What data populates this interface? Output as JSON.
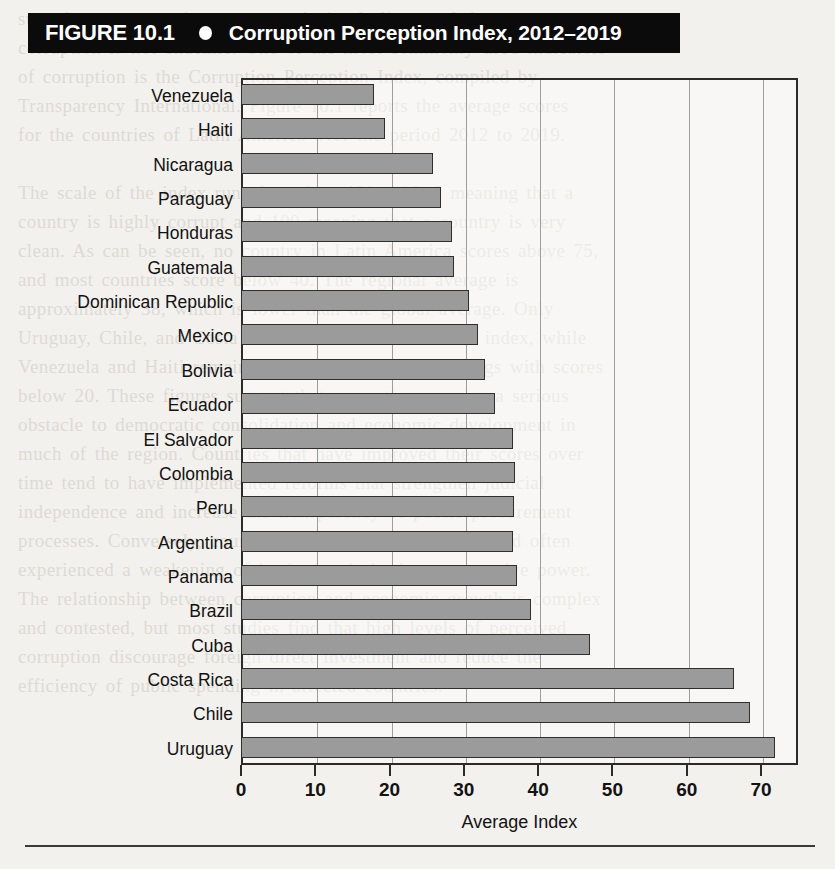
{
  "figure": {
    "label": "FIGURE 10.1",
    "bullet_icon": "bullet-dot-icon",
    "title": "Corruption Perception Index, 2012–2019"
  },
  "axis": {
    "x_title": "Average Index",
    "ticks": [
      "0",
      "10",
      "20",
      "30",
      "40",
      "50",
      "60",
      "70"
    ]
  },
  "colors": {
    "banner_background": "#0b0b0b",
    "banner_text": "#ffffff",
    "bar_fill": "#9b9b9b",
    "bar_border": "#2e2e2e",
    "grid": "#9d9d9d",
    "page_background": "#f3f1ed"
  },
  "ghost_text": "sure that a country is transparent in its dealings and that\ncorruption is not endemic. One of the most commonly used indicators\nof corruption is the Corruption Perception Index, compiled by\nTransparency International. Figure 10.1 reports the average scores\nfor the countries of Latin America over the period 2012 to 2019.\n\nThe scale of the index runs from 0 to 100, with 0 meaning that a\ncountry is highly corrupt and 100 meaning that a country is very\nclean. As can be seen, no country in Latin America scores above 75,\nand most countries score below 40. The regional average is\napproximately 38, which is lower than the global average. Only\nUruguay, Chile, and Costa Rica score above 60 on the index, while\nVenezuela and Haiti remain at the bottom of the rankings with scores\nbelow 20. These figures suggest that corruption remains a serious\nobstacle to democratic consolidation and economic development in\nmuch of the region. Countries that have improved their scores over\ntime tend to have implemented reforms that strengthen judicial\nindependence and increase the transparency of public procurement\nprocesses. Conversely, countries whose scores have declined often\nexperienced a weakening of institutional checks on executive power.\nThe relationship between corruption and economic growth is complex\nand contested, but most studies find that high levels of perceived\ncorruption discourage foreign direct investment and reduce the\nefficiency of public spending in affected countries.",
  "chart_data": {
    "type": "bar",
    "orientation": "horizontal",
    "title": "Corruption Perception Index, 2012–2019",
    "xlabel": "Average Index",
    "ylabel": "",
    "xlim": [
      0,
      75
    ],
    "xticks": [
      0,
      10,
      20,
      30,
      40,
      50,
      60,
      70
    ],
    "grid": "vertical",
    "legend": "none",
    "categories": [
      "Venezuela",
      "Haiti",
      "Nicaragua",
      "Paraguay",
      "Honduras",
      "Guatemala",
      "Dominican Republic",
      "Mexico",
      "Bolivia",
      "Ecuador",
      "El Salvador",
      "Colombia",
      "Peru",
      "Argentina",
      "Panama",
      "Brazil",
      "Cuba",
      "Costa Rica",
      "Chile",
      "Uruguay"
    ],
    "values": [
      17.9,
      19.4,
      25.8,
      26.9,
      28.4,
      28.7,
      30.7,
      31.9,
      32.8,
      34.2,
      36.6,
      36.9,
      36.8,
      36.6,
      37.1,
      39.0,
      47.0,
      66.4,
      68.5,
      71.9
    ]
  }
}
